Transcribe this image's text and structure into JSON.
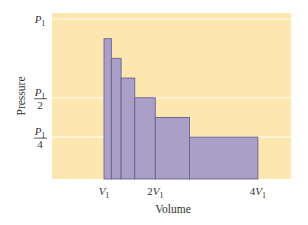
{
  "chart_data": {
    "type": "bar",
    "subtype": "step-histogram (variable-width bars)",
    "title": "",
    "xlabel": "Volume",
    "ylabel": "Pressure",
    "x_unit": "V1",
    "y_unit": "P1",
    "xlim": [
      0,
      4.6
    ],
    "ylim": [
      0,
      1.0
    ],
    "x_ticks": [
      {
        "value": 1,
        "label_main": "V",
        "label_sub": "1",
        "prefix": ""
      },
      {
        "value": 2,
        "label_main": "V",
        "label_sub": "1",
        "prefix": "2"
      },
      {
        "value": 4,
        "label_main": "V",
        "label_sub": "1",
        "prefix": "4"
      }
    ],
    "y_ticks": [
      {
        "value": 1.0,
        "numerator": "P",
        "numerator_sub": "1",
        "denominator": ""
      },
      {
        "value": 0.5,
        "numerator": "P",
        "numerator_sub": "1",
        "denominator": "2"
      },
      {
        "value": 0.25,
        "numerator": "P",
        "numerator_sub": "1",
        "denominator": "4"
      }
    ],
    "grid": {
      "horizontal_lines_at": [
        1.0,
        0.5,
        0.25
      ],
      "color": "#ffffff"
    },
    "bars": [
      {
        "x_start": 1.0,
        "x_end": 1.1429,
        "height": 0.875
      },
      {
        "x_start": 1.1429,
        "x_end": 1.3333,
        "height": 0.75
      },
      {
        "x_start": 1.3333,
        "x_end": 1.6,
        "height": 0.625
      },
      {
        "x_start": 1.6,
        "x_end": 2.0,
        "height": 0.5
      },
      {
        "x_start": 2.0,
        "x_end": 2.6667,
        "height": 0.375
      },
      {
        "x_start": 2.6667,
        "x_end": 4.0,
        "height": 0.25
      }
    ],
    "legend": null
  },
  "colors": {
    "panel": "#FBE7AF",
    "bar_fill": "#A99FC7",
    "bar_stroke": "#6B6193",
    "grid": "#FFF6DA",
    "text": "#333333"
  },
  "layout": {
    "panel": {
      "x": 52,
      "y": 13,
      "w": 239,
      "h": 166
    },
    "x0_px": 52.7,
    "px_per_x": 51.3,
    "y0_px": 176.5,
    "px_per_y": 157.5
  }
}
